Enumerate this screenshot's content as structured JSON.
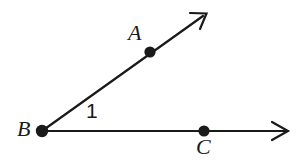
{
  "figure": {
    "type": "geometry-diagram",
    "background_color": "#ffffff",
    "stroke_color": "#1a1a1a",
    "stroke_width": 2.2,
    "canvas": {
      "width": 298,
      "height": 167
    }
  },
  "labels": {
    "vertex_b": "B",
    "point_a": "A",
    "point_c": "C",
    "angle_number": "1"
  },
  "geometry": {
    "vertex": {
      "name": "B",
      "x": 42,
      "y": 131,
      "dot_radius": 6.2
    },
    "points": [
      {
        "name": "A",
        "x": 150,
        "y": 52,
        "dot_radius": 5.6
      },
      {
        "name": "C",
        "x": 204,
        "y": 131,
        "dot_radius": 5.6
      }
    ],
    "rays": [
      {
        "name": "ray-BA",
        "from": {
          "x": 42,
          "y": 131
        },
        "to": {
          "x": 206,
          "y": 14
        },
        "arrow": "open-v"
      },
      {
        "name": "ray-BC",
        "from": {
          "x": 42,
          "y": 131
        },
        "to": {
          "x": 288,
          "y": 131
        },
        "arrow": "open-v"
      }
    ],
    "label_positions": {
      "A": {
        "x": 128,
        "y": 22
      },
      "B": {
        "x": 17,
        "y": 118
      },
      "C": {
        "x": 196,
        "y": 136
      },
      "angle_1": {
        "x": 86,
        "y": 100
      }
    }
  }
}
